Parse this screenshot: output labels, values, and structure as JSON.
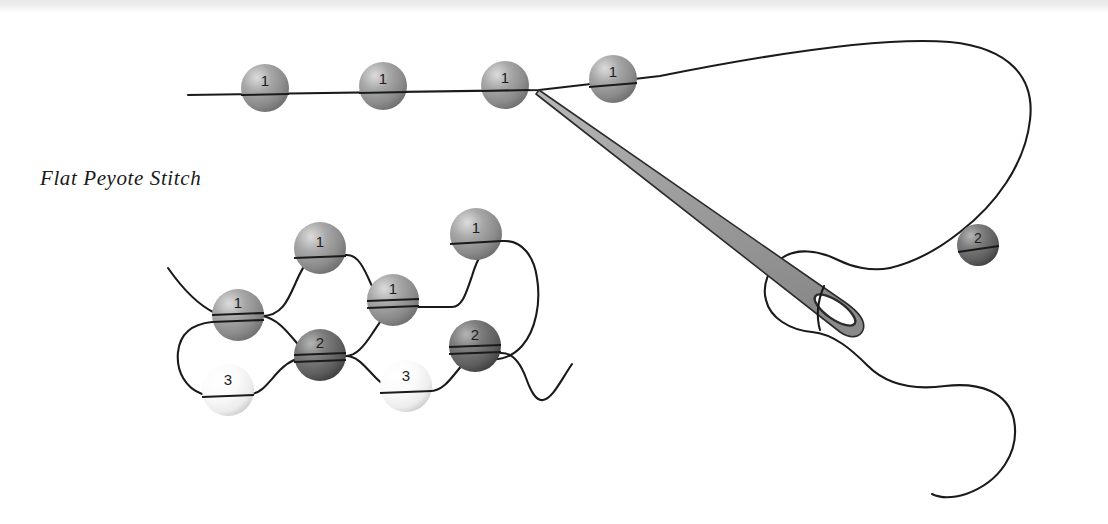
{
  "figure": {
    "title": "Flat Peyote Stitch",
    "medium": "line-drawing-illustration",
    "background_color": "#ffffff",
    "thread_color": "#1a1a1a",
    "needle_fill": "#9a9a9a",
    "needle_outline": "#2b2b2b"
  },
  "bead_types": [
    {
      "label": "1",
      "name": "row-one-bead",
      "tone": "medium-gray",
      "color": "#9a9a9a",
      "highlight": "#dcdcdc",
      "shadow": "#6e6e6e"
    },
    {
      "label": "2",
      "name": "row-two-bead",
      "tone": "dark-gray",
      "color": "#6d6d6d",
      "highlight": "#b4b4b4",
      "shadow": "#3f3f3f"
    },
    {
      "label": "3",
      "name": "row-three-bead",
      "tone": "light-white",
      "color": "#f2f2f2",
      "highlight": "#ffffff",
      "shadow": "#c9c9c9"
    }
  ],
  "top_diagram": {
    "name": "threaded-needle-with-bead-row",
    "beads": [
      {
        "label": "1",
        "type": 0,
        "cx": 265,
        "cy": 88,
        "r": 24
      },
      {
        "label": "1",
        "type": 0,
        "cx": 383,
        "cy": 86,
        "r": 24
      },
      {
        "label": "1",
        "type": 0,
        "cx": 505,
        "cy": 85,
        "r": 24
      },
      {
        "label": "1",
        "type": 0,
        "cx": 613,
        "cy": 79,
        "r": 24
      },
      {
        "label": "2",
        "type": 1,
        "cx": 978,
        "cy": 245,
        "r": 21
      }
    ],
    "needle": {
      "tip_x": 539,
      "tip_y": 90,
      "eye_x": 852,
      "eye_y": 318,
      "width": 14
    }
  },
  "bottom_diagram": {
    "name": "flat-peyote-stitch-detail",
    "beads": [
      {
        "label": "1",
        "type": 0,
        "cx": 320,
        "cy": 248,
        "r": 26
      },
      {
        "label": "1",
        "type": 0,
        "cx": 476,
        "cy": 234,
        "r": 26
      },
      {
        "label": "1",
        "type": 0,
        "cx": 238,
        "cy": 315,
        "r": 26
      },
      {
        "label": "1",
        "type": 0,
        "cx": 393,
        "cy": 300,
        "r": 26
      },
      {
        "label": "2",
        "type": 1,
        "cx": 320,
        "cy": 355,
        "r": 26
      },
      {
        "label": "2",
        "type": 1,
        "cx": 475,
        "cy": 346,
        "r": 26
      },
      {
        "label": "3",
        "type": 2,
        "cx": 228,
        "cy": 390,
        "r": 26
      },
      {
        "label": "3",
        "type": 2,
        "cx": 406,
        "cy": 386,
        "r": 26
      }
    ]
  }
}
